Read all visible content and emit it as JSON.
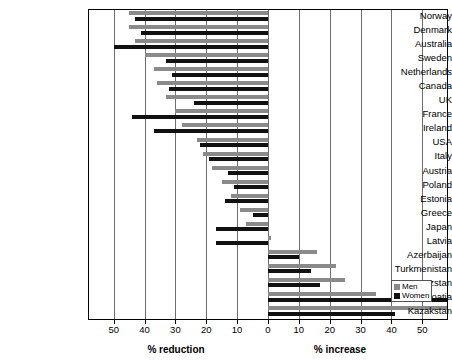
{
  "chart_data": {
    "type": "bar",
    "title": "",
    "orientation": "horizontal",
    "xlabel_left": "% reduction",
    "xlabel_right": "% increase",
    "ylabel": "",
    "xlim": [
      -58,
      58
    ],
    "xticks_left": [
      50,
      40,
      30,
      20,
      10,
      0
    ],
    "xticks_right": [
      0,
      10,
      20,
      30,
      40,
      50
    ],
    "grid": true,
    "legend_position": "bottom-right",
    "legend": [
      "Men",
      "Women"
    ],
    "note": "Negative values = % reduction, positive values = % increase",
    "categories": [
      "Norway",
      "Denmark",
      "Australia",
      "Sweden",
      "Netherlands",
      "Canada",
      "UK",
      "France",
      "Ireland",
      "USA",
      "Italy",
      "Austria",
      "Poland",
      "Estonia",
      "Greece",
      "Japan",
      "Latvia",
      "Azerbaijan",
      "Turkmenistan",
      "Kyrgyzstan",
      "Croatia",
      "Kazakstan"
    ],
    "series": [
      {
        "name": "Men",
        "color": "#8a8a8a",
        "values": [
          -45,
          -45,
          -43,
          -40,
          -37,
          -36,
          -33,
          -30,
          -28,
          -23,
          -21,
          -18,
          -15,
          -12,
          -9,
          -7,
          1,
          16,
          22,
          25,
          35,
          58
        ]
      },
      {
        "name": "Women",
        "color": "#111111",
        "values": [
          -43,
          -41,
          -50,
          -33,
          -31,
          -32,
          -24,
          -44,
          -37,
          -22,
          -19,
          -13,
          -11,
          -14,
          -5,
          -17,
          -17,
          10,
          14,
          17,
          58,
          41
        ]
      }
    ]
  },
  "legend": {
    "men_label": "Men",
    "women_label": "Women"
  }
}
